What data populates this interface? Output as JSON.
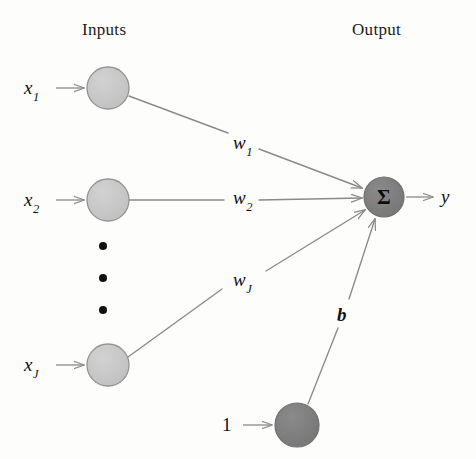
{
  "figure": {
    "type": "diagram",
    "background_color": "#fdfdfc"
  },
  "headings": {
    "inputs": "Inputs",
    "output": "Output"
  },
  "colors": {
    "input_node_fill": "#c6c6c6",
    "input_node_stroke": "#8f8f8f",
    "output_node_fill": "#7e7e7e",
    "output_node_stroke": "#6a6a6a",
    "bias_node_fill": "#7e7e7e",
    "bias_node_stroke": "#6a6a6a",
    "edge_stroke": "#8a8a8a",
    "arrow_stroke": "#8a8a8a",
    "text": "#101010",
    "dot_fill": "#111111"
  },
  "input_nodes": [
    {
      "id": "x1",
      "label": "x",
      "subscript": "1",
      "cx": 108,
      "cy": 88,
      "r": 21
    },
    {
      "id": "x2",
      "label": "x",
      "subscript": "2",
      "cx": 108,
      "cy": 200,
      "r": 21
    },
    {
      "id": "xJ",
      "label": "x",
      "subscript": "J",
      "cx": 108,
      "cy": 365,
      "r": 21
    }
  ],
  "bias_node": {
    "id": "bias",
    "input_label": "1",
    "cx": 297,
    "cy": 425,
    "r": 22
  },
  "output_node": {
    "id": "sum",
    "glyph": "Σ",
    "cx": 384,
    "cy": 197,
    "r": 20
  },
  "output_signal": {
    "label": "y"
  },
  "weights": [
    {
      "id": "w1",
      "label": "w",
      "subscript": "1",
      "from": "x1",
      "to": "sum",
      "x": 239,
      "y": 144
    },
    {
      "id": "w2",
      "label": "w",
      "subscript": "2",
      "from": "x2",
      "to": "sum",
      "x": 239,
      "y": 199
    },
    {
      "id": "wJ",
      "label": "w",
      "subscript": "J",
      "from": "xJ",
      "to": "sum",
      "x": 239,
      "y": 281
    }
  ],
  "bias_weight": {
    "id": "b",
    "label": "b",
    "from": "bias",
    "to": "sum",
    "x": 341,
    "y": 316
  },
  "ellipsis_dots": [
    {
      "cx": 103,
      "cy": 246,
      "r": 4
    },
    {
      "cx": 103,
      "cy": 278,
      "r": 4
    },
    {
      "cx": 103,
      "cy": 310,
      "r": 4
    }
  ],
  "input_arrows": [
    {
      "for": "x1",
      "x1": 56,
      "y1": 88,
      "x2": 83,
      "y2": 88
    },
    {
      "for": "x2",
      "x1": 56,
      "y1": 200,
      "x2": 83,
      "y2": 200
    },
    {
      "for": "xJ",
      "x1": 56,
      "y1": 365,
      "x2": 83,
      "y2": 365
    },
    {
      "for": "bias",
      "x1": 243,
      "y1": 425,
      "x2": 271,
      "y2": 425
    }
  ]
}
